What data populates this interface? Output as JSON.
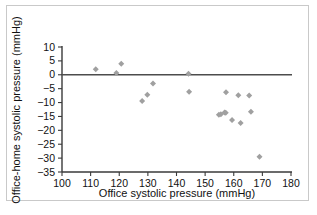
{
  "chart_data": {
    "type": "scatter",
    "title": "",
    "xlabel": "Office systolic pressure (mmHg)",
    "ylabel": "Office-home systolic pressure (mmHg)",
    "xlim": [
      100,
      180
    ],
    "ylim": [
      -35,
      10
    ],
    "xticks": [
      100,
      110,
      120,
      130,
      140,
      150,
      160,
      170,
      180
    ],
    "yticks": [
      10,
      5,
      0,
      -5,
      -10,
      -15,
      -20,
      -25,
      -30,
      -35
    ],
    "xtick_labels": [
      "100",
      "110",
      "120",
      "130",
      "140",
      "150",
      "160",
      "170",
      "180"
    ],
    "ytick_labels": [
      "10",
      "5",
      "0",
      "−5",
      "−10",
      "−15",
      "−20",
      "−25",
      "−30",
      "−35"
    ],
    "grid": false,
    "legend": null,
    "reference_lines": [
      {
        "orientation": "horizontal",
        "value": 0,
        "color": "#4d4d4d"
      }
    ],
    "marker": {
      "shape": "diamond",
      "color": "#a0a0a0",
      "size": 6
    },
    "series": [
      {
        "name": "Office minus home systolic pressure",
        "points": [
          {
            "x": 111.8,
            "y": 2.0
          },
          {
            "x": 119.0,
            "y": 0.6
          },
          {
            "x": 120.7,
            "y": 4.0
          },
          {
            "x": 128.0,
            "y": -9.4
          },
          {
            "x": 129.8,
            "y": -7.2
          },
          {
            "x": 131.8,
            "y": -3.1
          },
          {
            "x": 144.2,
            "y": 0.4
          },
          {
            "x": 144.4,
            "y": -6.1
          },
          {
            "x": 154.8,
            "y": -14.4
          },
          {
            "x": 155.5,
            "y": -14.2
          },
          {
            "x": 156.8,
            "y": -13.6
          },
          {
            "x": 157.2,
            "y": -13.7
          },
          {
            "x": 157.3,
            "y": -6.3
          },
          {
            "x": 159.4,
            "y": -16.3
          },
          {
            "x": 161.6,
            "y": -7.4
          },
          {
            "x": 162.4,
            "y": -17.4
          },
          {
            "x": 165.4,
            "y": -7.5
          },
          {
            "x": 166.0,
            "y": -13.3
          },
          {
            "x": 169.0,
            "y": -29.5
          }
        ]
      }
    ]
  }
}
